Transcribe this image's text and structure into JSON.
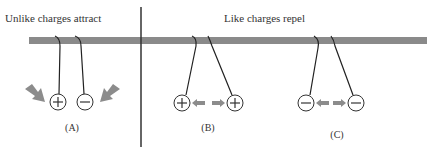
{
  "headings": {
    "left": "Unlike charges attract",
    "right": "Like charges repel"
  },
  "panels": [
    {
      "label": "(A)",
      "charges": [
        "+",
        "−"
      ],
      "force": "attract"
    },
    {
      "label": "(B)",
      "charges": [
        "+",
        "+"
      ],
      "force": "repel"
    },
    {
      "label": "(C)",
      "charges": [
        "−",
        "−"
      ],
      "force": "repel"
    }
  ],
  "colors": {
    "bar": "#8a8a8a",
    "arrow": "#8c8c8c",
    "line": "#222222",
    "text": "#333333"
  }
}
